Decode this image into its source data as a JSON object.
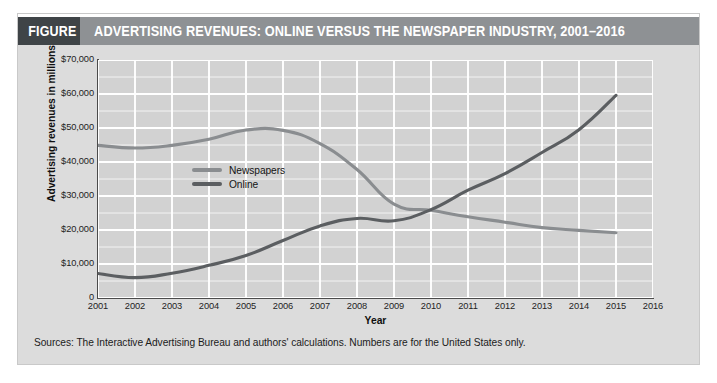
{
  "figure": {
    "number_label": "FIGURE 10–1",
    "title": "ADVERTISING REVENUES: ONLINE VERSUS THE NEWSPAPER INDUSTRY, 2001–2016",
    "source_note": "Sources: The Interactive Advertising Bureau and authors' calculations. Numbers are for the United States only.",
    "title_bar_color": "#8e9194",
    "figure_number_bg": "#3f4447",
    "title_text_color": "#ffffff",
    "panel_bg": "#dcdcdc",
    "plot_bg": "#d2d2d2",
    "gridline_color": "#ffffff"
  },
  "chart_data": {
    "type": "line",
    "title": "ADVERTISING REVENUES: ONLINE VERSUS THE NEWSPAPER INDUSTRY, 2001–2016",
    "xlabel": "Year",
    "ylabel": "Advertising revenues in millions",
    "xlim": [
      2001,
      2016
    ],
    "ylim": [
      0,
      70000
    ],
    "ytick_values": [
      0,
      10000,
      20000,
      30000,
      40000,
      50000,
      60000,
      70000
    ],
    "ytick_labels": [
      "0",
      "$10,000",
      "$20,000",
      "$30,000",
      "$40,000",
      "$50,000",
      "$60,000",
      "$70,000"
    ],
    "y_minor_step": 5000,
    "xtick_values": [
      2001,
      2002,
      2003,
      2004,
      2005,
      2006,
      2007,
      2008,
      2009,
      2010,
      2011,
      2012,
      2013,
      2014,
      2015,
      2016
    ],
    "xtick_labels": [
      "2001",
      "2002",
      "2003",
      "2004",
      "2005",
      "2006",
      "2007",
      "2008",
      "2009",
      "2010",
      "2011",
      "2012",
      "2013",
      "2014",
      "2015",
      "2016"
    ],
    "grid": true,
    "legend_position": "inside-left",
    "x": [
      2001,
      2002,
      2003,
      2004,
      2005,
      2006,
      2007,
      2008,
      2009,
      2010,
      2011,
      2012,
      2013,
      2014,
      2015
    ],
    "series": [
      {
        "name": "Newspapers",
        "color": "#8a8d90",
        "values": [
          44900,
          44100,
          44900,
          46700,
          49400,
          49300,
          45400,
          37800,
          27600,
          25800,
          23900,
          22300,
          20700,
          19900,
          19200
        ]
      },
      {
        "name": "Online",
        "color": "#5b5e61",
        "values": [
          7200,
          6000,
          7300,
          9600,
          12500,
          16900,
          21200,
          23400,
          22700,
          26000,
          31700,
          36600,
          42800,
          49500,
          59600
        ]
      }
    ]
  },
  "legend": {
    "items": [
      {
        "label": "Newspapers",
        "color": "#8a8d90"
      },
      {
        "label": "Online",
        "color": "#5b5e61"
      }
    ]
  }
}
